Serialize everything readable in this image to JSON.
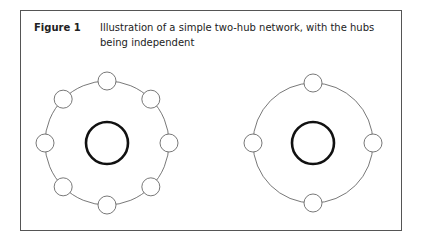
{
  "figure": {
    "label": "Figure 1",
    "caption": "Illustration of a simple two-hub network, with the hubs being independent"
  },
  "networks": [
    {
      "name": "left-network",
      "cx": 107,
      "cy": 143,
      "ring_r": 62,
      "hub_r": 21,
      "node_r": 9,
      "spokes": 8
    },
    {
      "name": "right-network",
      "cx": 313,
      "cy": 143,
      "ring_r": 60,
      "hub_r": 21,
      "node_r": 9,
      "spokes": 4
    }
  ],
  "colors": {
    "ring": "#555555",
    "hub": "#111111",
    "node_stroke": "#555555",
    "frame": "#555555"
  }
}
